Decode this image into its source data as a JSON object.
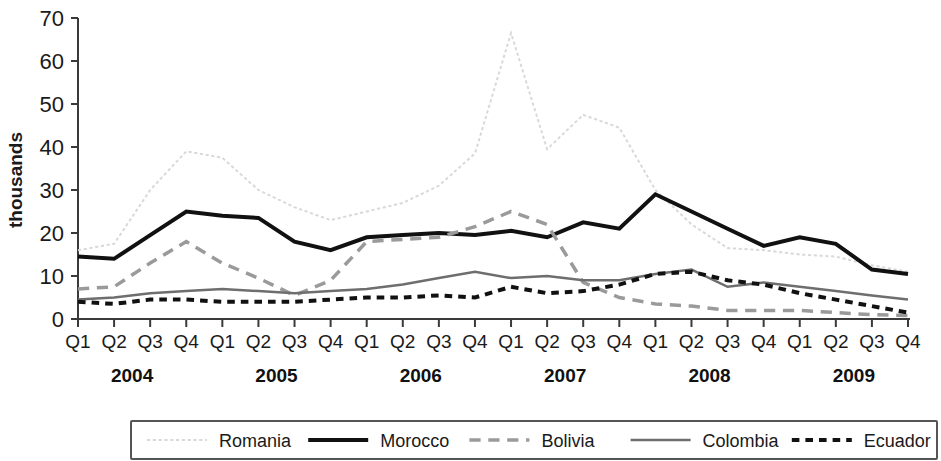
{
  "chart_data": {
    "type": "line",
    "title": "",
    "xlabel": "",
    "ylabel": "thousands",
    "ylim": [
      0,
      70
    ],
    "yticks": [
      0,
      10,
      20,
      30,
      40,
      50,
      60,
      70
    ],
    "ytick_labels": [
      "0",
      "10",
      "20",
      "30",
      "40",
      "50",
      "60",
      "70"
    ],
    "grid": false,
    "legend_position": "bottom",
    "x": [
      "Q1",
      "Q2",
      "Q3",
      "Q4",
      "Q1",
      "Q2",
      "Q3",
      "Q4",
      "Q1",
      "Q2",
      "Q3",
      "Q4",
      "Q1",
      "Q2",
      "Q3",
      "Q4",
      "Q1",
      "Q2",
      "Q3",
      "Q4",
      "Q1",
      "Q2",
      "Q3",
      "Q4"
    ],
    "x_groups": [
      {
        "label": "2004",
        "start": 0,
        "end": 3
      },
      {
        "label": "2005",
        "start": 4,
        "end": 7
      },
      {
        "label": "2006",
        "start": 8,
        "end": 11
      },
      {
        "label": "2007",
        "start": 12,
        "end": 15
      },
      {
        "label": "2008",
        "start": 16,
        "end": 19
      },
      {
        "label": "2009",
        "start": 20,
        "end": 23
      }
    ],
    "series": [
      {
        "name": "Romania",
        "color": "#d9d9d9",
        "style": "dotted",
        "width": 2,
        "values": [
          16,
          17.5,
          30,
          39,
          37.5,
          30,
          26,
          23,
          25,
          27,
          31,
          38.5,
          66.5,
          39.5,
          47.5,
          44.5,
          30,
          22,
          16.5,
          16,
          15,
          14.5,
          12.5,
          11
        ]
      },
      {
        "name": "Morocco",
        "color": "#111111",
        "style": "solid",
        "width": 4,
        "values": [
          14.5,
          14,
          19.5,
          25,
          24,
          23.5,
          18,
          16,
          19,
          19.5,
          20,
          19.5,
          20.5,
          19,
          22.5,
          21,
          29,
          25,
          21,
          17,
          19,
          17.5,
          11.5,
          10.5
        ]
      },
      {
        "name": "Bolivia",
        "color": "#9a9a9a",
        "style": "dashed",
        "width": 3.5,
        "values": [
          7,
          7.5,
          13,
          18,
          13,
          9.5,
          5.5,
          9,
          18,
          18.5,
          19,
          21.5,
          25,
          22,
          8.5,
          5,
          3.5,
          3,
          2,
          2,
          2,
          1.5,
          1,
          0.8
        ]
      },
      {
        "name": "Colombia",
        "color": "#6e6e6e",
        "style": "solid",
        "width": 2.5,
        "values": [
          4.5,
          5,
          6,
          6.5,
          7,
          6.5,
          6,
          6.5,
          7,
          8,
          9.5,
          11,
          9.5,
          10,
          9,
          9,
          10.5,
          11.5,
          7.5,
          8.5,
          7.5,
          6.5,
          5.5,
          4.5
        ]
      },
      {
        "name": "Ecuador",
        "color": "#111111",
        "style": "dotted-thick",
        "width": 4,
        "values": [
          4,
          3.5,
          4.5,
          4.5,
          4,
          4,
          4,
          4.5,
          5,
          5,
          5.5,
          5,
          7.5,
          6,
          6.5,
          8,
          10.5,
          11,
          9,
          8,
          6,
          4.5,
          3,
          1.5
        ]
      }
    ]
  },
  "legend": {
    "items": [
      {
        "label": "Romania"
      },
      {
        "label": "Morocco"
      },
      {
        "label": "Bolivia"
      },
      {
        "label": "Colombia"
      },
      {
        "label": "Ecuador"
      }
    ]
  }
}
